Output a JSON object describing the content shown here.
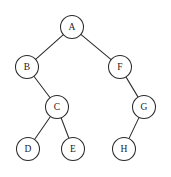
{
  "figure": {
    "background_color": "#ffffff",
    "stroke_color": "#2b2b2b",
    "label_color": "#1a1a1a",
    "node_fill": "#ffffff",
    "node_radius": 11.5,
    "width": 171,
    "height": 177
  },
  "diagram_data": {
    "type": "tree",
    "node_count": 8,
    "edge_count": 7,
    "root": "A",
    "nodes": [
      {
        "id": "A",
        "label": "A",
        "cx": 72,
        "cy": 27,
        "depth": 0
      },
      {
        "id": "B",
        "label": "B",
        "cx": 27,
        "cy": 67,
        "depth": 1
      },
      {
        "id": "F",
        "label": "F",
        "cx": 120,
        "cy": 67,
        "depth": 1
      },
      {
        "id": "C",
        "label": "C",
        "cx": 57,
        "cy": 107,
        "depth": 2
      },
      {
        "id": "G",
        "label": "G",
        "cx": 144,
        "cy": 107,
        "depth": 2
      },
      {
        "id": "D",
        "label": "D",
        "cx": 28,
        "cy": 149,
        "depth": 3
      },
      {
        "id": "E",
        "label": "E",
        "cx": 73,
        "cy": 149,
        "depth": 3
      },
      {
        "id": "H",
        "label": "H",
        "cx": 124,
        "cy": 149,
        "depth": 3
      }
    ],
    "edges": [
      {
        "from": "A",
        "to": "B",
        "side": "left"
      },
      {
        "from": "A",
        "to": "F",
        "side": "right"
      },
      {
        "from": "B",
        "to": "C",
        "side": "right"
      },
      {
        "from": "C",
        "to": "D",
        "side": "left"
      },
      {
        "from": "C",
        "to": "E",
        "side": "right"
      },
      {
        "from": "F",
        "to": "G",
        "side": "right"
      },
      {
        "from": "G",
        "to": "H",
        "side": "left"
      }
    ]
  }
}
